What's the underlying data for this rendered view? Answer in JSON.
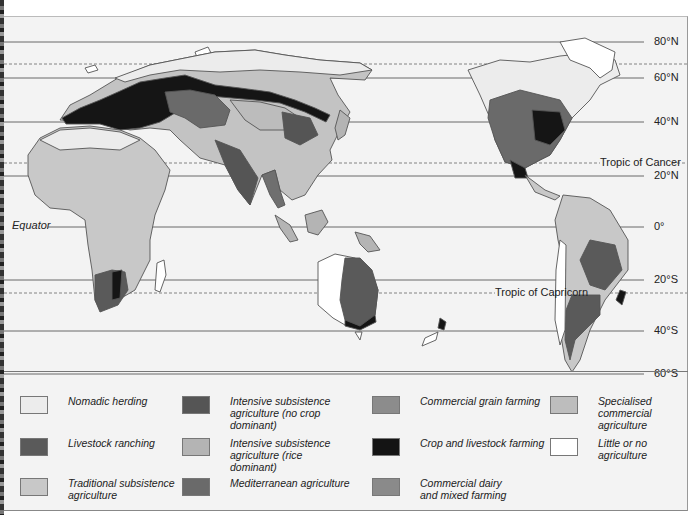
{
  "map": {
    "title": "World agricultural regions",
    "latitude_labels": {
      "n80": "80°N",
      "n60": "60°N",
      "n40": "40°N",
      "tropic_cancer": "Tropic of Cancer",
      "n20": "20°N",
      "equator": "Equator",
      "zero": "0°",
      "s20": "20°S",
      "tropic_capricorn": "Tropic of Capricorn",
      "s40": "40°S",
      "s60": "60°S"
    },
    "colors": {
      "ocean": "#f3f3f3",
      "coastline": "#555555",
      "gridline": "#444444"
    }
  },
  "legend": {
    "items": [
      {
        "label": "Nomadic herding",
        "color": "#ececec"
      },
      {
        "label": "Livestock ranching",
        "color": "#5a5a5a"
      },
      {
        "label": "Traditional subsistence agriculture",
        "color": "#c8c8c8"
      },
      {
        "label": "Intensive subsistence agriculture (no crop dominant)",
        "color": "#555555"
      },
      {
        "label": "Intensive subsistence agriculture (rice dominant)",
        "color": "#b4b4b4"
      },
      {
        "label": "Mediterranean agriculture",
        "color": "#6a6a6a"
      },
      {
        "label": "Commercial grain farming",
        "color": "#8c8c8c"
      },
      {
        "label": "Crop and livestock farming",
        "color": "#141414"
      },
      {
        "label": "Commercial dairy and mixed farming",
        "color": "#8a8a8a"
      },
      {
        "label": "Specialised commercial agriculture",
        "color": "#bdbdbd"
      },
      {
        "label": "Little or no agriculture",
        "color": "#ffffff"
      }
    ]
  }
}
